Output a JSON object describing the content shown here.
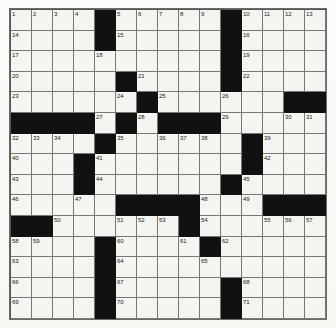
{
  "puzzle": {
    "title": "Crossword Grid",
    "rows": 15,
    "columns": 15,
    "colors": {
      "block": "#111111",
      "cell": "#f4f4f0",
      "grid_line": "#777777",
      "number_text": "#1a1a1a",
      "page_background": "#f9f9f6"
    },
    "blocks": [
      [
        0,
        4
      ],
      [
        0,
        10
      ],
      [
        1,
        4
      ],
      [
        1,
        10
      ],
      [
        2,
        10
      ],
      [
        3,
        5
      ],
      [
        3,
        10
      ],
      [
        4,
        6
      ],
      [
        4,
        13
      ],
      [
        4,
        14
      ],
      [
        5,
        0
      ],
      [
        5,
        1
      ],
      [
        5,
        2
      ],
      [
        5,
        3
      ],
      [
        5,
        5
      ],
      [
        5,
        7
      ],
      [
        5,
        8
      ],
      [
        5,
        9
      ],
      [
        6,
        4
      ],
      [
        6,
        11
      ],
      [
        7,
        3
      ],
      [
        7,
        11
      ],
      [
        8,
        3
      ],
      [
        8,
        10
      ],
      [
        9,
        5
      ],
      [
        9,
        6
      ],
      [
        9,
        7
      ],
      [
        9,
        8
      ],
      [
        9,
        12
      ],
      [
        9,
        13
      ],
      [
        9,
        14
      ],
      [
        10,
        0
      ],
      [
        10,
        1
      ],
      [
        10,
        8
      ],
      [
        11,
        4
      ],
      [
        11,
        9
      ],
      [
        12,
        4
      ],
      [
        13,
        4
      ],
      [
        13,
        10
      ],
      [
        14,
        4
      ],
      [
        14,
        10
      ]
    ],
    "numbers": [
      {
        "row": 0,
        "col": 0,
        "n": "1"
      },
      {
        "row": 0,
        "col": 1,
        "n": "2"
      },
      {
        "row": 0,
        "col": 2,
        "n": "3"
      },
      {
        "row": 0,
        "col": 3,
        "n": "4"
      },
      {
        "row": 0,
        "col": 5,
        "n": "5"
      },
      {
        "row": 0,
        "col": 6,
        "n": "6"
      },
      {
        "row": 0,
        "col": 7,
        "n": "7"
      },
      {
        "row": 0,
        "col": 8,
        "n": "8"
      },
      {
        "row": 0,
        "col": 9,
        "n": "9"
      },
      {
        "row": 0,
        "col": 11,
        "n": "10"
      },
      {
        "row": 0,
        "col": 12,
        "n": "11"
      },
      {
        "row": 0,
        "col": 13,
        "n": "12"
      },
      {
        "row": 0,
        "col": 14,
        "n": "13"
      },
      {
        "row": 1,
        "col": 0,
        "n": "14"
      },
      {
        "row": 1,
        "col": 5,
        "n": "15"
      },
      {
        "row": 1,
        "col": 11,
        "n": "16"
      },
      {
        "row": 2,
        "col": 0,
        "n": "17"
      },
      {
        "row": 2,
        "col": 4,
        "n": "18"
      },
      {
        "row": 2,
        "col": 11,
        "n": "19"
      },
      {
        "row": 3,
        "col": 0,
        "n": "20"
      },
      {
        "row": 3,
        "col": 6,
        "n": "21"
      },
      {
        "row": 3,
        "col": 11,
        "n": "22"
      },
      {
        "row": 4,
        "col": 0,
        "n": "23"
      },
      {
        "row": 4,
        "col": 5,
        "n": "24"
      },
      {
        "row": 4,
        "col": 7,
        "n": "25"
      },
      {
        "row": 4,
        "col": 10,
        "n": "26"
      },
      {
        "row": 5,
        "col": 4,
        "n": "27"
      },
      {
        "row": 5,
        "col": 6,
        "n": "28"
      },
      {
        "row": 5,
        "col": 10,
        "n": "29"
      },
      {
        "row": 5,
        "col": 13,
        "n": "30"
      },
      {
        "row": 5,
        "col": 14,
        "n": "31"
      },
      {
        "row": 6,
        "col": 0,
        "n": "32"
      },
      {
        "row": 6,
        "col": 1,
        "n": "33"
      },
      {
        "row": 6,
        "col": 2,
        "n": "34"
      },
      {
        "row": 6,
        "col": 5,
        "n": "35"
      },
      {
        "row": 6,
        "col": 7,
        "n": "36"
      },
      {
        "row": 6,
        "col": 8,
        "n": "37"
      },
      {
        "row": 6,
        "col": 9,
        "n": "38"
      },
      {
        "row": 6,
        "col": 12,
        "n": "39"
      },
      {
        "row": 7,
        "col": 0,
        "n": "40"
      },
      {
        "row": 7,
        "col": 4,
        "n": "41"
      },
      {
        "row": 7,
        "col": 12,
        "n": "42"
      },
      {
        "row": 8,
        "col": 0,
        "n": "43"
      },
      {
        "row": 8,
        "col": 4,
        "n": "44"
      },
      {
        "row": 8,
        "col": 11,
        "n": "45"
      },
      {
        "row": 9,
        "col": 0,
        "n": "46"
      },
      {
        "row": 9,
        "col": 3,
        "n": "47"
      },
      {
        "row": 9,
        "col": 9,
        "n": "48"
      },
      {
        "row": 9,
        "col": 11,
        "n": "49"
      },
      {
        "row": 10,
        "col": 2,
        "n": "50"
      },
      {
        "row": 10,
        "col": 5,
        "n": "51"
      },
      {
        "row": 10,
        "col": 6,
        "n": "52"
      },
      {
        "row": 10,
        "col": 7,
        "n": "53"
      },
      {
        "row": 10,
        "col": 9,
        "n": "54"
      },
      {
        "row": 10,
        "col": 12,
        "n": "55"
      },
      {
        "row": 10,
        "col": 13,
        "n": "56"
      },
      {
        "row": 10,
        "col": 14,
        "n": "57"
      },
      {
        "row": 11,
        "col": 0,
        "n": "58"
      },
      {
        "row": 11,
        "col": 1,
        "n": "59"
      },
      {
        "row": 11,
        "col": 5,
        "n": "60"
      },
      {
        "row": 11,
        "col": 8,
        "n": "61"
      },
      {
        "row": 11,
        "col": 10,
        "n": "62"
      },
      {
        "row": 12,
        "col": 0,
        "n": "63"
      },
      {
        "row": 12,
        "col": 5,
        "n": "64"
      },
      {
        "row": 12,
        "col": 9,
        "n": "65"
      },
      {
        "row": 13,
        "col": 0,
        "n": "66"
      },
      {
        "row": 13,
        "col": 5,
        "n": "67"
      },
      {
        "row": 13,
        "col": 11,
        "n": "68"
      },
      {
        "row": 14,
        "col": 0,
        "n": "69"
      },
      {
        "row": 14,
        "col": 5,
        "n": "70"
      },
      {
        "row": 14,
        "col": 11,
        "n": "71"
      }
    ]
  }
}
